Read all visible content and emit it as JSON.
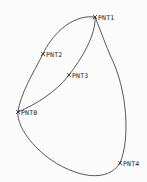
{
  "diagram": {
    "type": "spline-curve",
    "stroke_color": "#444444",
    "points": [
      {
        "name": "PNT0",
        "x": 18,
        "y": 112
      },
      {
        "name": "PNT1",
        "x": 95,
        "y": 17
      },
      {
        "name": "PNT2",
        "x": 43,
        "y": 54
      },
      {
        "name": "PNT3",
        "x": 69,
        "y": 75
      },
      {
        "name": "PNT4",
        "x": 120,
        "y": 163
      }
    ]
  }
}
